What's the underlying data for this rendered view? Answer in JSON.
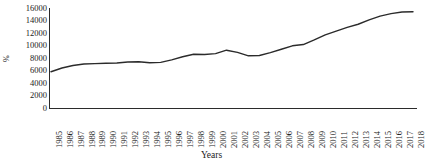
{
  "chart_data": {
    "type": "line",
    "title": "",
    "xlabel": "Years",
    "ylabel": "%",
    "ylim": [
      0,
      16000
    ],
    "ytick_values": [
      0,
      2000,
      4000,
      6000,
      8000,
      10000,
      12000,
      14000,
      16000
    ],
    "ytick_labels": [
      "0",
      "2000",
      "4000",
      "6000",
      "8000",
      "10000",
      "12000",
      "14000",
      "16000"
    ],
    "grid": false,
    "legend": "none",
    "line_color": "#2b2b2b",
    "categories": [
      "1985",
      "1986",
      "1987",
      "1988",
      "1989",
      "1990",
      "1991",
      "1992",
      "1993",
      "1994",
      "1995",
      "1996",
      "1997",
      "1998",
      "1999",
      "2000",
      "2001",
      "2002",
      "2003",
      "2004",
      "2005",
      "2006",
      "2007",
      "2008",
      "2009",
      "2010",
      "2011",
      "2012",
      "2013",
      "2014",
      "2015",
      "2016",
      "2017",
      "2018"
    ],
    "x": [
      1985,
      1986,
      1987,
      1988,
      1989,
      1990,
      1991,
      1992,
      1993,
      1994,
      1995,
      1996,
      1997,
      1998,
      1999,
      2000,
      2001,
      2002,
      2003,
      2004,
      2005,
      2006,
      2007,
      2008,
      2009,
      2010,
      2011,
      2012,
      2013,
      2014,
      2015,
      2016,
      2017,
      2018
    ],
    "values": [
      5800,
      6400,
      6800,
      7050,
      7100,
      7150,
      7200,
      7350,
      7400,
      7250,
      7300,
      7700,
      8200,
      8600,
      8550,
      8700,
      9250,
      8900,
      8350,
      8400,
      8850,
      9400,
      9950,
      10150,
      10900,
      11700,
      12300,
      12900,
      13400,
      14100,
      14700,
      15100,
      15350,
      15400
    ],
    "series": [
      {
        "name": "",
        "values": [
          5800,
          6400,
          6800,
          7050,
          7100,
          7150,
          7200,
          7350,
          7400,
          7250,
          7300,
          7700,
          8200,
          8600,
          8550,
          8700,
          9250,
          8900,
          8350,
          8400,
          8850,
          9400,
          9950,
          10150,
          10900,
          11700,
          12300,
          12900,
          13400,
          14100,
          14700,
          15100,
          15350,
          15400
        ]
      }
    ]
  }
}
